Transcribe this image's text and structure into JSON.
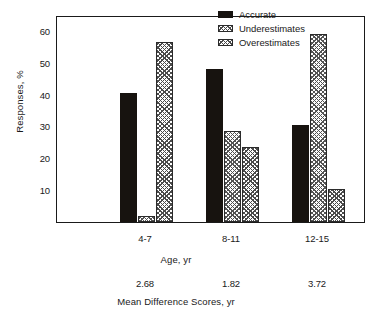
{
  "chart_data": {
    "type": "bar",
    "title": "",
    "subtitle": "",
    "xlabel": "Age, yr",
    "ylabel": "Responses, %",
    "categories": [
      "4-7",
      "8-11",
      "12-15"
    ],
    "series": [
      {
        "name": "Accurate",
        "values": [
          40.5,
          48.0,
          30.5
        ]
      },
      {
        "name": "Underestimates",
        "values": [
          2.0,
          28.5,
          59.0
        ]
      },
      {
        "name": "Overestimates",
        "values": [
          56.5,
          23.5,
          10.5
        ]
      }
    ],
    "ylim": [
      0,
      65
    ],
    "yticks": [
      10,
      20,
      30,
      40,
      50,
      60
    ],
    "ytick_labels": [
      "10",
      "20",
      "30",
      "40",
      "50",
      "60"
    ],
    "grid": false,
    "legend_position": "top-right",
    "legend_entries": [
      "Accurate",
      "Underestimates",
      "Overestimates"
    ],
    "secondary_axis": {
      "label": "Mean Difference Scores, yr",
      "values": [
        "2.68",
        "1.82",
        "3.72"
      ]
    },
    "colors": {
      "accurate": "#17130f",
      "underestimates": "#fdfdfd",
      "overestimates": "#fdfdfd",
      "axis": "#1a1a1a",
      "background": "#ffffff"
    }
  }
}
